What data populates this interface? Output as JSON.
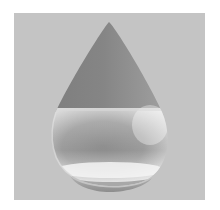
{
  "image": {
    "subject": "water-drop",
    "background_color": "#ffffff",
    "panel_color": "#c4c4c4",
    "drop_colors": {
      "upper_dark": "#8a8a8a",
      "tip": "#707070",
      "liquid_highlight": "#e4e4e4",
      "liquid_core": "#8e8e8e",
      "rim_light": "#f2f2f2",
      "base_shadow": "#9a9a9a"
    }
  }
}
